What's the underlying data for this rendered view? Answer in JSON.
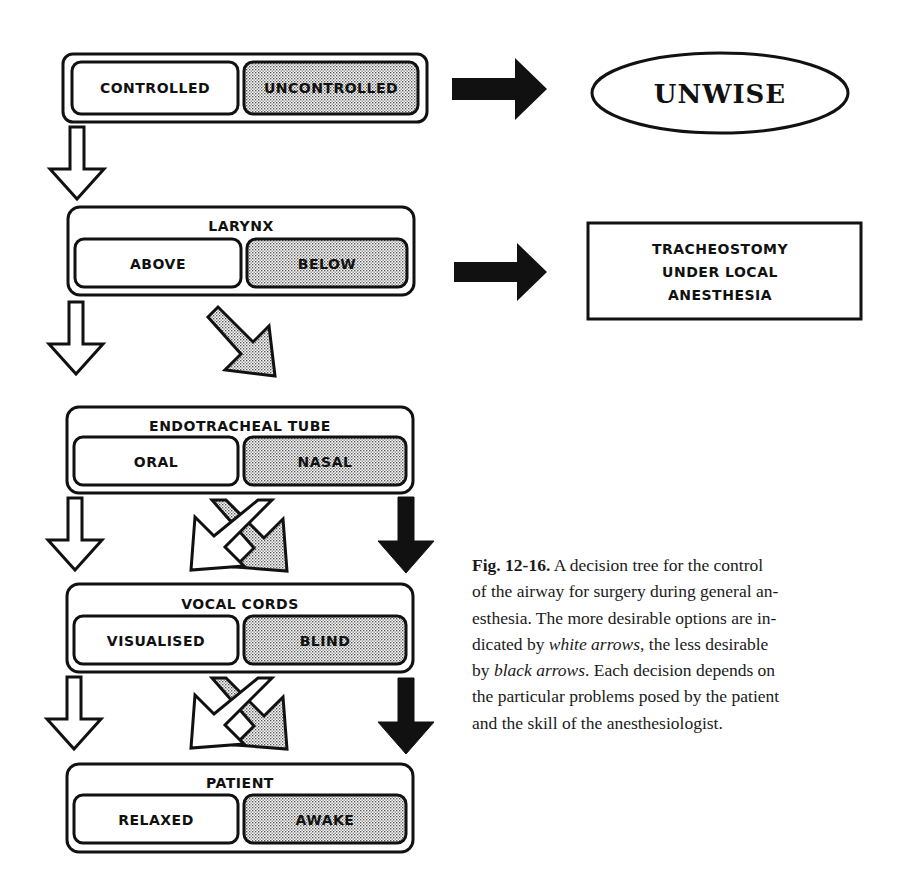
{
  "figure": {
    "nodes": [
      {
        "id": "control",
        "header": "",
        "options": [
          "CONTROLLED",
          "UNCONTROLLED"
        ]
      },
      {
        "id": "larynx",
        "header": "LARYNX",
        "options": [
          "ABOVE",
          "BELOW"
        ]
      },
      {
        "id": "tube",
        "header": "ENDOTRACHEAL TUBE",
        "options": [
          "ORAL",
          "NASAL"
        ]
      },
      {
        "id": "cords",
        "header": "VOCAL CORDS",
        "options": [
          "VISUALISED",
          "BLIND"
        ]
      },
      {
        "id": "patient",
        "header": "PATIENT",
        "options": [
          "RELAXED",
          "AWAKE"
        ]
      }
    ],
    "outcomes": {
      "unwise": "UNWISE",
      "tracheostomy": [
        "TRACHEOSTOMY",
        "UNDER LOCAL",
        "ANESTHESIA"
      ]
    },
    "legend": {
      "white_arrow": "more desirable",
      "black_arrow": "less desirable",
      "shaded_option": "less desirable choice"
    },
    "colors": {
      "ink": "#111111",
      "shade": "#d9d9d9",
      "paper": "#ffffff"
    }
  },
  "caption": {
    "label": "Fig. 12-16.",
    "line1": " A decision tree for the control",
    "line2": "of the airway for surgery during general an-",
    "line3": "esthesia. The more desirable options are in-",
    "line4a": "dicated by ",
    "line4_ital": "white arrows",
    "line4b": ", the less desirable",
    "line5a": "by ",
    "line5_ital": "black arrows",
    "line5b": ". Each decision depends on",
    "line6": "the particular problems posed by the patient",
    "line7": "and the skill of the anesthesiologist."
  }
}
